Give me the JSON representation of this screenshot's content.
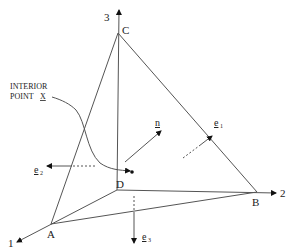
{
  "diagram": {
    "axes": [
      {
        "label": "1"
      },
      {
        "label": "2"
      },
      {
        "label": "3"
      }
    ],
    "vertices": [
      {
        "label": "A"
      },
      {
        "label": "B"
      },
      {
        "label": "C"
      },
      {
        "label": "D"
      }
    ],
    "interior_point": {
      "line1": "INTERIOR",
      "line2": "POINT",
      "symbol": "X"
    },
    "vectors": {
      "n": {
        "label": "n"
      },
      "e1": {
        "label": "e",
        "subscript": "1"
      },
      "e2": {
        "label": "e",
        "subscript": "2"
      },
      "e3": {
        "label": "e",
        "subscript": "3"
      }
    },
    "colors": {
      "line": "#555555",
      "text": "#222222",
      "background": "#ffffff"
    }
  }
}
